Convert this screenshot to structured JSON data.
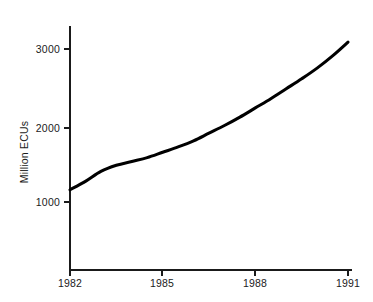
{
  "chart_data": {
    "type": "line",
    "title": "",
    "subtitle": "",
    "xlabel": "",
    "ylabel": "Million ECUs",
    "xlim": [
      1982,
      1991
    ],
    "ylim": [
      0,
      3300
    ],
    "grid": false,
    "legend": null,
    "x_ticks": [
      "1982",
      "1985",
      "1988",
      "1991"
    ],
    "x_tick_values": [
      1982,
      1985,
      1988,
      1991
    ],
    "y_ticks": [
      "1000",
      "2000",
      "3000"
    ],
    "y_tick_values": [
      1000,
      2000,
      3000
    ],
    "series": [
      {
        "name": "Million ECUs",
        "x": [
          1982,
          1982.5,
          1983,
          1983.5,
          1984,
          1984.5,
          1985,
          1985.5,
          1986,
          1986.5,
          1987,
          1987.5,
          1988,
          1988.5,
          1989,
          1989.5,
          1990,
          1990.5,
          1991
        ],
        "values": [
          1160,
          1270,
          1400,
          1480,
          1530,
          1580,
          1650,
          1720,
          1800,
          1900,
          2000,
          2110,
          2230,
          2350,
          2480,
          2610,
          2750,
          2910,
          3090
        ]
      }
    ],
    "annotations": []
  },
  "axes": {
    "y_axis_title": "Million ECUs",
    "x_axis_title": ""
  }
}
